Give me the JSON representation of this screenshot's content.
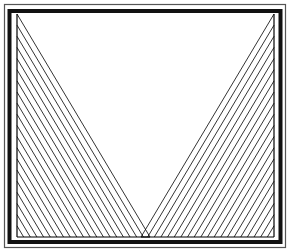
{
  "diagram": {
    "type": "string-art-envelope",
    "canvas": {
      "width": 290,
      "height": 252
    },
    "colors": {
      "background": "#ffffff",
      "ink": "#000000",
      "outer_line": "#555555"
    },
    "frame": {
      "outer": {
        "x": 4.5,
        "y": 4.5,
        "w": 281,
        "h": 243
      },
      "thick": {
        "x": 9.5,
        "y": 11,
        "w": 271,
        "h": 231
      }
    },
    "left_curve": {
      "vertical_axis": {
        "x": 17,
        "y_top": 14,
        "y_bottom": 237
      },
      "horizontal_axis": {
        "y": 237,
        "x_start": 17,
        "x_end": 150
      },
      "line_count": 20
    },
    "right_curve": {
      "vertical_axis": {
        "x": 274,
        "y_top": 14,
        "y_bottom": 237
      },
      "horizontal_axis": {
        "y": 237,
        "x_start": 274,
        "x_end": 141
      },
      "line_count": 20
    }
  }
}
